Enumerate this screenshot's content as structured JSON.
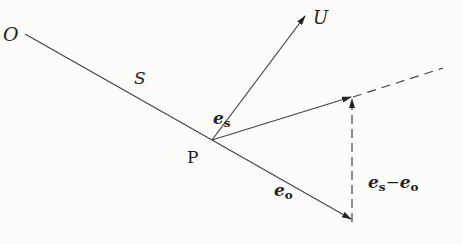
{
  "diagram": {
    "labels": {
      "origin": "O",
      "path": "S",
      "point": "P",
      "u_vector": "U",
      "es": {
        "base": "e",
        "sub": "s"
      },
      "eo": {
        "base": "e",
        "sub": "o"
      },
      "diff": {
        "a_base": "e",
        "a_sub": "s",
        "minus": "−",
        "b_base": "e",
        "b_sub": "o"
      }
    },
    "colors": {
      "line": "#333333",
      "background": "#fcfcfb"
    }
  }
}
